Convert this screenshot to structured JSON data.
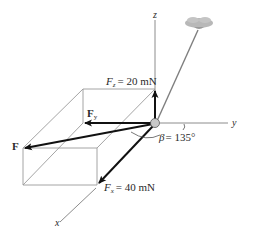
{
  "diagram": {
    "type": "3d-force-vector",
    "axes": {
      "x_label": "x",
      "y_label": "y",
      "z_label": "z"
    },
    "vectors": {
      "resultant": {
        "label": "F"
      },
      "fy": {
        "label": "F",
        "subscript": "y"
      },
      "fz": {
        "label": "F",
        "subscript": "z",
        "value_text": "= 20 mN"
      },
      "fx": {
        "label": "F",
        "subscript": "x",
        "value_text": "= 40 mN"
      }
    },
    "angle": {
      "symbol": "β",
      "value_text": "= 135°"
    },
    "colors": {
      "vector": "#111111",
      "axis": "#8c8c8c",
      "box": "#9a9a9a",
      "support": "#b8b8b8"
    }
  }
}
